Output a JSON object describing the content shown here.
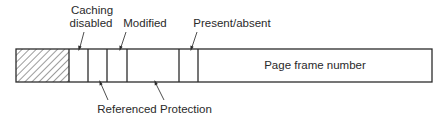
{
  "diagram": {
    "fields": [
      {
        "id": "reserved",
        "label": "",
        "x0": 16,
        "x1": 69,
        "hatched": true
      },
      {
        "id": "caching_disabled",
        "label": "Caching disabled",
        "x0": 69,
        "x1": 88
      },
      {
        "id": "referenced",
        "label": "Referenced",
        "x0": 88,
        "x1": 107
      },
      {
        "id": "modified",
        "label": "Modified",
        "x0": 107,
        "x1": 127
      },
      {
        "id": "protection",
        "label": "Protection",
        "x0": 127,
        "x1": 179
      },
      {
        "id": "present_absent",
        "label": "Present/absent",
        "x0": 179,
        "x1": 198
      },
      {
        "id": "page_frame_number",
        "label": "Page frame number",
        "x0": 198,
        "x1": 432
      }
    ],
    "labels": {
      "caching_disabled_line1": "Caching",
      "caching_disabled_line2": "disabled",
      "modified": "Modified",
      "present_absent": "Present/absent",
      "referenced": "Referenced",
      "protection": "Protection",
      "page_frame_number": "Page frame number"
    },
    "colors": {
      "stroke": "#2b2b2b",
      "text": "#2a2a2a",
      "background": "#ffffff"
    }
  }
}
